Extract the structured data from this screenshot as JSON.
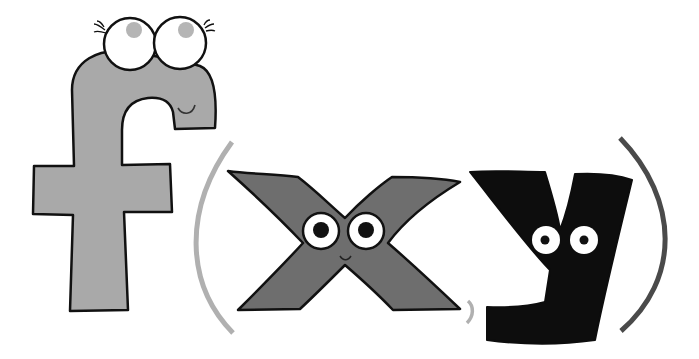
{
  "illustration": {
    "expression": "f(x,y)",
    "glyphs": [
      {
        "char": "f",
        "role": "function-letter",
        "fill": "#a9a9a9",
        "face": "eyelashes-eyes-smile"
      },
      {
        "char": "(",
        "role": "open-paren",
        "stroke": "#b0b0b0"
      },
      {
        "char": "x",
        "role": "variable-x",
        "fill": "#6e6e6e",
        "face": "eyes-smile"
      },
      {
        "char": ",",
        "role": "comma",
        "stroke": "#b0b0b0"
      },
      {
        "char": "y",
        "role": "variable-y",
        "fill": "#0d0d0d",
        "face": "eyes"
      },
      {
        "char": ")",
        "role": "close-paren",
        "stroke": "#4a4a4a"
      }
    ],
    "colors": {
      "background": "#ffffff",
      "outline": "#111111",
      "f_fill": "#a9a9a9",
      "x_fill": "#6e6e6e",
      "y_fill": "#0d0d0d",
      "open_paren": "#b0b0b0",
      "close_paren": "#4a4a4a",
      "pupil_f": "#b5b5b5",
      "pupil": "#111111"
    }
  }
}
